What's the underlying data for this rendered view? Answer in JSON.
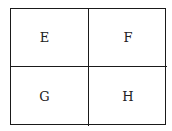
{
  "diagram": {
    "type": "2x2 grid",
    "cells": [
      {
        "label": "E"
      },
      {
        "label": "F"
      },
      {
        "label": "G"
      },
      {
        "label": "H"
      }
    ]
  }
}
